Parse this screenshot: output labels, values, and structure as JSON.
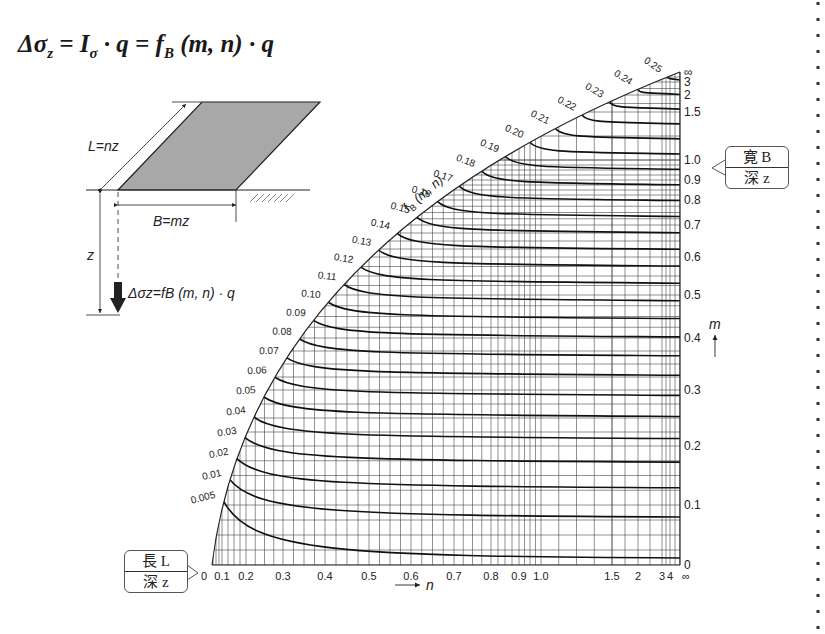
{
  "formula": {
    "lhs": "Δσ",
    "lhs_sub": "z",
    "eq1": " = I",
    "i_sub": "σ",
    "mid": " · q = f",
    "f_sub": "B",
    "rhs": " (m, n) · q"
  },
  "diagram": {
    "length_label": "L=nz",
    "width_label": "B=mz",
    "depth_label": "z",
    "stress_label": "Δσz=fB (m, n) · q"
  },
  "callouts": {
    "width_ratio": {
      "top": "寛 B",
      "bottom": "深 z"
    },
    "length_ratio": {
      "top": "長 L",
      "bottom": "深 z"
    }
  },
  "chart_data": {
    "type": "line",
    "title": "fB (m, n)",
    "xlabel": "n",
    "ylabel": "m",
    "x_axis_arrow": "→ n",
    "y_axis_arrow": "m ↑",
    "x_ticks": [
      "0",
      "0.1",
      "0.2",
      "0.3",
      "0.4",
      "0.5",
      "0.6",
      "0.7",
      "0.8",
      "0.9",
      "1.0",
      "1.5",
      "2",
      "3",
      "4",
      "∞"
    ],
    "y_ticks": [
      "0",
      "0.1",
      "0.2",
      "0.3",
      "0.4",
      "0.5",
      "0.6",
      "0.7",
      "0.8",
      "0.9",
      "1.0",
      "1.5",
      "2",
      "3",
      "∞"
    ],
    "curve_labels": [
      "0.005",
      "0.01",
      "0.02",
      "0.03",
      "0.04",
      "0.05",
      "0.06",
      "0.07",
      "0.08",
      "0.09",
      "0.10",
      "0.11",
      "0.12",
      "0.13",
      "0.14",
      "0.15",
      "0.16",
      "0.17",
      "0.18",
      "0.19",
      "0.20",
      "0.21",
      "0.22",
      "0.23",
      "0.24",
      "0.25"
    ],
    "scale": "nonlinear (log-like), grid on"
  }
}
